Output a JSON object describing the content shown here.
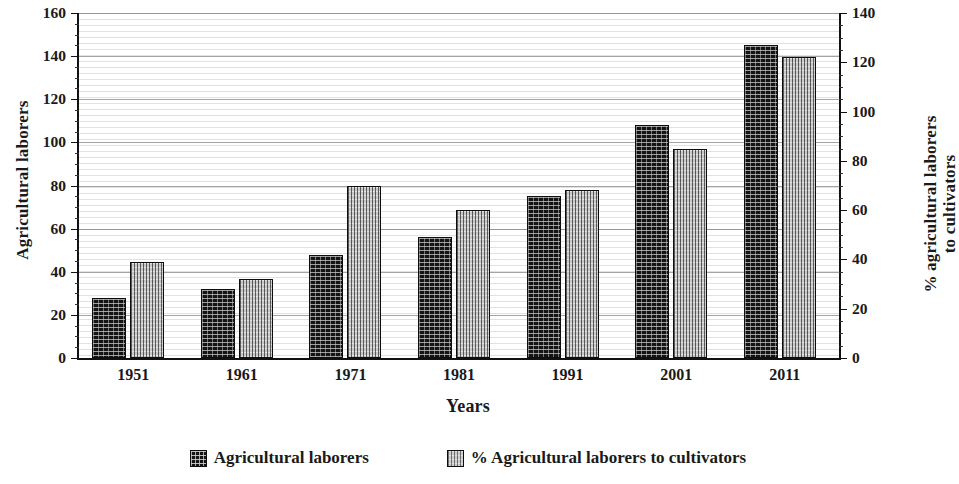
{
  "chart_data": {
    "type": "bar",
    "title": "",
    "xlabel": "Years",
    "categories": [
      "1951",
      "1961",
      "1971",
      "1981",
      "1991",
      "2001",
      "2011"
    ],
    "series": [
      {
        "name": "Agricultural laborers",
        "axis": "left",
        "swatch": "dark",
        "values": [
          28,
          32,
          48,
          56,
          75,
          108,
          145
        ]
      },
      {
        "name": "% Agricultural laborers to cultivators",
        "axis": "right",
        "swatch": "light",
        "values": [
          39,
          32,
          70,
          60,
          68,
          85,
          122
        ]
      }
    ],
    "left_axis": {
      "label": "Agricultural laborers",
      "min": 0,
      "max": 160,
      "tick_step": 20,
      "minor_step": 5,
      "ticks": [
        "0",
        "20",
        "40",
        "60",
        "80",
        "100",
        "120",
        "140",
        "160"
      ]
    },
    "right_axis": {
      "label": "% agricultural laborers to cultivators",
      "label_lines": [
        "% agricultural laborers",
        "to cultivators"
      ],
      "min": 0,
      "max": 140,
      "tick_step": 20,
      "minor_step": 5,
      "ticks": [
        "0",
        "20",
        "40",
        "60",
        "80",
        "100",
        "120",
        "140"
      ]
    },
    "grid": {
      "horizontal_major": true,
      "horizontal_minor_texture": true,
      "vertical": false
    },
    "legend": {
      "position": "bottom-center",
      "entries": [
        {
          "label": "Agricultural laborers",
          "swatch": "dark"
        },
        {
          "label": "% Agricultural laborers to cultivators",
          "swatch": "light"
        }
      ]
    },
    "colors": {
      "series_dark": "#141414",
      "series_light": "#c8c8c8",
      "axis": "#111111",
      "grid": "#787880",
      "background": "#ffffff"
    }
  }
}
